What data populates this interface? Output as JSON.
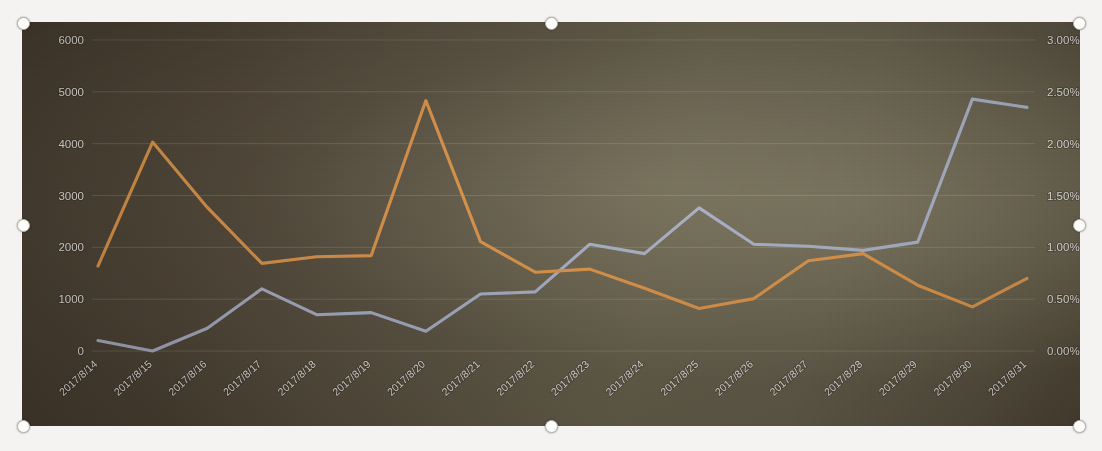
{
  "chart_data": {
    "type": "line",
    "title": "",
    "xlabel": "",
    "ylabel": "",
    "categories": [
      "2017/8/14",
      "2017/8/15",
      "2017/8/16",
      "2017/8/17",
      "2017/8/18",
      "2017/8/19",
      "2017/8/20",
      "2017/8/21",
      "2017/8/22",
      "2017/8/23",
      "2017/8/24",
      "2017/8/25",
      "2017/8/26",
      "2017/8/27",
      "2017/8/28",
      "2017/8/29",
      "2017/8/30",
      "2017/8/31"
    ],
    "series": [
      {
        "name": "series-blue",
        "axis": "right",
        "color": "#a9b0c6",
        "values": [
          0.1,
          0.0,
          0.22,
          0.6,
          0.35,
          0.37,
          0.19,
          0.55,
          0.57,
          1.03,
          0.94,
          1.38,
          1.03,
          1.01,
          0.97,
          1.05,
          2.43,
          2.35
        ],
        "values_secondary_scale": [
          190,
          0,
          440,
          1210,
          700,
          740,
          390,
          1100,
          1140,
          2060,
          1880,
          2770,
          2060,
          2030,
          1950,
          2100,
          4870,
          4700
        ]
      },
      {
        "name": "series-orange",
        "axis": "left",
        "color": "#dd9447",
        "values": [
          1640,
          4030,
          2770,
          1690,
          1820,
          1840,
          4830,
          2110,
          1520,
          1580,
          1210,
          820,
          1010,
          1740,
          1880,
          1270,
          850,
          1400
        ]
      }
    ],
    "left_axis": {
      "ticks": [
        "0",
        "1000",
        "2000",
        "3000",
        "4000",
        "5000",
        "6000"
      ],
      "min": 0,
      "max": 6000,
      "step": 1000
    },
    "right_axis": {
      "ticks": [
        "0.00%",
        "0.50%",
        "1.00%",
        "1.50%",
        "2.00%",
        "2.50%",
        "3.00%"
      ],
      "min": 0,
      "max": 3.0,
      "step": 0.5
    },
    "grid": true,
    "legend": "none",
    "colors": {
      "blue": "#a9b0c6",
      "orange": "#dd9447",
      "plot_background": "#5d5442",
      "tick_text": "#e9e5de",
      "gridline": "rgba(232,226,214,0.17)"
    }
  },
  "object": {
    "name": "chart-object",
    "selected": true,
    "handle_count": 8
  },
  "ghost_caption": {
    "left_fragment": "    ",
    "right_fragment": "    "
  }
}
